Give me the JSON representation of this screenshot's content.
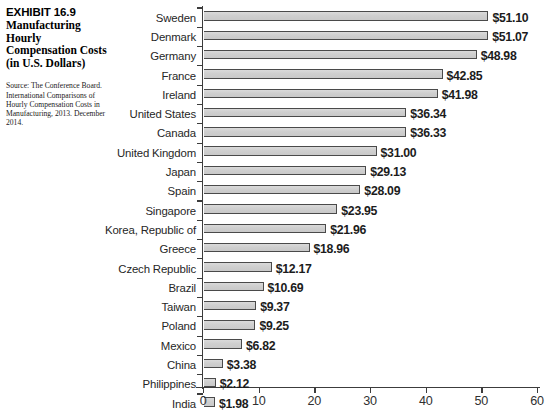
{
  "caption": {
    "exhibit_number": "EXHIBIT 16.9",
    "title": "Manufacturing Hourly Compensation Costs (in U.S. Dollars)",
    "source": "Source: The Conference Board. International Comparisons of Hourly Compensation Costs in Manufacturing, 2013. December 2014."
  },
  "chart_data": {
    "type": "bar",
    "orientation": "horizontal",
    "title": "Manufacturing Hourly Compensation Costs (in U.S. Dollars)",
    "xlabel": "",
    "ylabel": "",
    "xlim": [
      0,
      60
    ],
    "xticks": [
      0,
      10,
      20,
      30,
      40,
      50,
      60
    ],
    "xtick_labels": [
      "0",
      "10",
      "20",
      "30",
      "40",
      "50",
      "60"
    ],
    "grid": false,
    "legend": false,
    "bar_color": "#d2d2d2",
    "bar_edge_color": "#4a4a4a",
    "categories": [
      "Sweden",
      "Denmark",
      "Germany",
      "France",
      "Ireland",
      "United States",
      "Canada",
      "United Kingdom",
      "Japan",
      "Spain",
      "Singapore",
      "Korea, Republic of",
      "Greece",
      "Czech Republic",
      "Brazil",
      "Taiwan",
      "Poland",
      "Mexico",
      "China",
      "Philippines",
      "India"
    ],
    "values": [
      51.1,
      51.07,
      48.98,
      42.85,
      41.98,
      36.34,
      36.33,
      31.0,
      29.13,
      28.09,
      23.95,
      21.96,
      18.96,
      12.17,
      10.69,
      9.37,
      9.25,
      6.82,
      3.38,
      2.12,
      1.98
    ],
    "data_labels": [
      "$51.10",
      "$51.07",
      "$48.98",
      "$42.85",
      "$41.98",
      "$36.34",
      "$36.33",
      "$31.00",
      "$29.13",
      "$28.09",
      "$23.95",
      "$21.96",
      "$18.96",
      "$12.17",
      "$10.69",
      "$9.37",
      "$9.25",
      "$6.82",
      "$3.38",
      "$2.12",
      "$1.98"
    ]
  }
}
